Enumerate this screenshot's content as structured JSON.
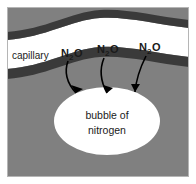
{
  "figure": {
    "colors": {
      "tissue": "#808080",
      "vessel_wall": "#3a3a3a",
      "lumen": "#ffffff",
      "bubble": "#ffffff",
      "outline": "#b5b5b5",
      "text": "#1a1a1a",
      "arrow": "#000000",
      "background": "#ffffff"
    },
    "border": {
      "color": "#b5b5b5",
      "width": 1
    }
  },
  "labels": {
    "capillary": "capillary",
    "bubble_line1": "bubble of",
    "bubble_line2": "nitrogen"
  },
  "gas_labels": [
    {
      "formula": "N",
      "subscript": "2",
      "element": "O",
      "full": "N2O",
      "x": 62,
      "y": 56
    },
    {
      "formula": "N",
      "subscript": "2",
      "element": "O",
      "full": "N2O",
      "x": 98,
      "y": 52
    },
    {
      "formula": "N",
      "subscript": "2",
      "element": "O",
      "full": "N2O",
      "x": 140,
      "y": 50
    }
  ],
  "arrows": [
    {
      "name": "arrow-left",
      "path": "M 68 60 C 66 74 72 86 80 98"
    },
    {
      "name": "arrow-middle",
      "path": "M 104 57 C 100 72 104 86 110 98"
    },
    {
      "name": "arrow-right",
      "path": "M 146 55 C 140 68 136 82 135 96"
    }
  ],
  "regions": {
    "tissue_label": "surrounding tissue",
    "upper_wall_label": "upper capillary wall",
    "lower_wall_label": "lower capillary wall",
    "lumen_label": "capillary lumen",
    "bubble_label": "nitrogen bubble"
  }
}
